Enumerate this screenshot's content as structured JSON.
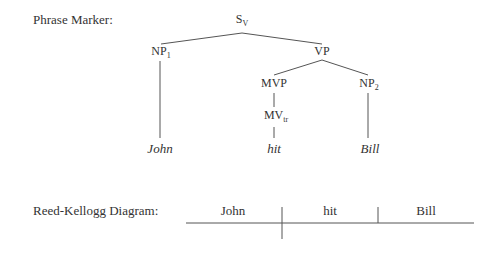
{
  "phrase_marker": {
    "label": "Phrase Marker:",
    "nodes": {
      "s": {
        "base": "S",
        "sub": "V"
      },
      "np1": {
        "base": "NP",
        "sub": "1"
      },
      "vp": {
        "base": "VP",
        "sub": ""
      },
      "mvp": {
        "base": "MVP",
        "sub": ""
      },
      "np2": {
        "base": "NP",
        "sub": "2"
      },
      "mv": {
        "base": "MV",
        "sub": "tr"
      }
    },
    "words": [
      "John",
      "hit",
      "Bill"
    ]
  },
  "reed_kellogg": {
    "label": "Reed-Kellogg Diagram:",
    "words": [
      "John",
      "hit",
      "Bill"
    ]
  },
  "colors": {
    "ink": "#333333",
    "line": "#555555"
  }
}
